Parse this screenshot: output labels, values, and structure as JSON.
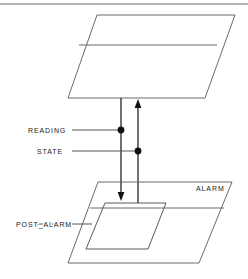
{
  "figure": {
    "type": "layered-block-diagram",
    "background_color": "#ffffff",
    "line_color": "#5a5a5a",
    "accent_color": "#111111",
    "top_rule": {
      "present": true,
      "y": 4,
      "x1": 0,
      "x2": 248
    }
  },
  "labels": {
    "reading": "READING",
    "state": "STATE",
    "alarm": "ALARM",
    "post_alarm": "POST_ALARM"
  },
  "planes": [
    {
      "id": "upper-plane",
      "name": "upper-plane",
      "label": "",
      "points": "97,15 235,15 205,98 68,98",
      "divider": "79,45 217,45"
    },
    {
      "id": "alarm-plane",
      "name": "alarm-plane",
      "label": "ALARM",
      "points": "98,182 232,182 199,263 68,263",
      "divider": "90,208 224,208"
    },
    {
      "id": "post-alarm-plane",
      "name": "post-alarm-plane",
      "label": "POST_ALARM",
      "points": "105,203 166,203 148,249 86,249",
      "divider": ""
    }
  ],
  "connectors": [
    {
      "id": "reading-flow",
      "name": "reading-flow-arrow",
      "direction": "down",
      "x": 121,
      "y_start": 98,
      "y_end": 200,
      "source_label": "READING"
    },
    {
      "id": "state-flow",
      "name": "state-flow-arrow",
      "direction": "up",
      "x": 138,
      "y_start": 203,
      "y_end": 99,
      "source_label": "STATE"
    }
  ],
  "signal_labels": [
    {
      "id": "reading",
      "name": "reading-signal",
      "text": "READING",
      "text_x": 28,
      "text_y": 133,
      "leader_x1": 72,
      "leader_x2": 121,
      "leader_y": 130,
      "dot_x": 121,
      "dot_y": 130
    },
    {
      "id": "state",
      "name": "state-signal",
      "text": "STATE",
      "text_x": 37,
      "text_y": 154,
      "leader_x1": 72,
      "leader_x2": 138,
      "leader_y": 151,
      "dot_x": 138,
      "dot_y": 151
    },
    {
      "id": "post-alarm",
      "name": "post-alarm-signal",
      "text": "POST_ALARM",
      "text_x": 16,
      "text_y": 227,
      "leader_x1": 15,
      "leader_x2": 92,
      "leader_y": 224,
      "dot_x": null,
      "dot_y": null
    }
  ]
}
